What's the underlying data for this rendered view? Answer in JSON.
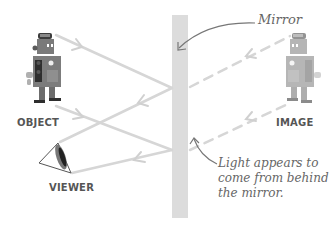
{
  "diagram": {
    "labels": {
      "object": "OBJECT",
      "image": "IMAGE",
      "viewer": "VIEWER",
      "mirror": "Mirror",
      "note_lines": [
        "Light appears to",
        "come from behind",
        "the mirror."
      ]
    },
    "colors": {
      "mirror": "#dcdcdc",
      "ray": "#d6d6d6",
      "virtual_ray": "#d6d6d6",
      "label": "#555555",
      "annotation": "#666666",
      "robot_body": "#7a7a7a",
      "robot_dark": "#3c3c3c"
    },
    "elements": {
      "object": {
        "type": "robot",
        "position": "left"
      },
      "image": {
        "type": "robot",
        "position": "right",
        "style": "faded"
      },
      "viewer": {
        "type": "eye",
        "position": "lower-left"
      },
      "mirror": {
        "type": "vertical-bar",
        "position": "center"
      },
      "rays": [
        {
          "from": "object-top",
          "to": "mirror",
          "reflect_to": "viewer-top",
          "style": "solid"
        },
        {
          "from": "object-bottom",
          "to": "mirror",
          "reflect_to": "viewer-bottom",
          "style": "solid"
        }
      ],
      "virtual_rays": [
        {
          "from": "mirror",
          "to": "image-top",
          "style": "dashed"
        },
        {
          "from": "mirror",
          "to": "image-bottom",
          "style": "dashed"
        }
      ]
    }
  }
}
